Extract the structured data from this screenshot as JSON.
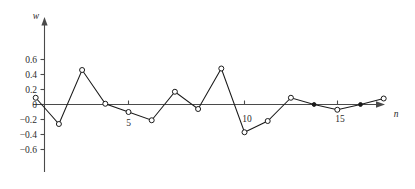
{
  "chart_data": {
    "type": "line",
    "title": "",
    "subtitle": "",
    "xlabel": "n",
    "ylabel": "w",
    "x": [
      1,
      2,
      3,
      4,
      5,
      6,
      7,
      8,
      9,
      10,
      11,
      12,
      13,
      14,
      15,
      16
    ],
    "values": [
      0.09,
      -0.26,
      0.46,
      0.01,
      -0.1,
      -0.21,
      0.17,
      -0.06,
      0.48,
      -0.37,
      -0.22,
      0.09,
      0.0,
      -0.07,
      0.0,
      0.08
    ],
    "marker_styles": [
      "open",
      "open",
      "open",
      "open",
      "open",
      "open",
      "open",
      "open",
      "open",
      "open",
      "open",
      "open",
      "filled",
      "open",
      "filled",
      "open"
    ],
    "series": [
      {
        "name": "w[n]",
        "values": [
          0.09,
          -0.26,
          0.46,
          0.01,
          -0.1,
          -0.21,
          0.17,
          -0.06,
          0.48,
          -0.37,
          -0.22,
          0.09,
          0.0,
          -0.07,
          0.0,
          0.08
        ]
      }
    ],
    "ylim": [
      -0.75,
      0.78
    ],
    "xlim": [
      0,
      18.4
    ],
    "y_ticks": [
      0.6,
      0.4,
      0.2,
      0,
      -0.2,
      -0.4,
      -0.6
    ],
    "y_tick_labels": [
      "0.6",
      "0.4",
      "0.2",
      "0",
      "−0.2",
      "−0.4",
      "−0.6"
    ],
    "x_ticks": [
      5,
      10,
      15
    ],
    "x_tick_labels": [
      "5",
      "10",
      "15"
    ],
    "grid": false,
    "legend": null,
    "legend_position": "none",
    "annotations": [],
    "line_color": "#1a1a1a",
    "axis_color": "#4a4a4a",
    "marker_fill_open": "#ffffff",
    "marker_fill_solid": "#1a1a1a",
    "background_color": "#ffffff"
  },
  "axis_labels": {
    "y_axis_title": "w",
    "x_axis_title": "n"
  },
  "y_tick_text": {
    "t0": "0.6",
    "t1": "0.4",
    "t2": "0.2",
    "t3": "0",
    "t4": "−0.2",
    "t5": "−0.4",
    "t6": "−0.6"
  },
  "x_tick_text": {
    "t0": "5",
    "t1": "10",
    "t2": "15"
  }
}
